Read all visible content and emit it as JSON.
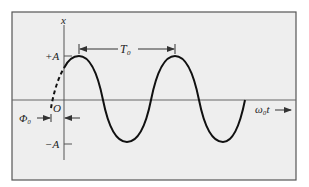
{
  "diagram": {
    "type": "sinusoid-phase-diagram",
    "y_axis_label": "x",
    "x_axis_label": "ω₀t",
    "amplitude_pos_label": "+A",
    "amplitude_neg_label": "−A",
    "origin_label": "O",
    "period_label": "T₀",
    "phase_label": "Φ₀",
    "colors": {
      "background": "#eeeeee",
      "frame": "#555555",
      "axis": "#555555",
      "curve": "#111111"
    }
  }
}
